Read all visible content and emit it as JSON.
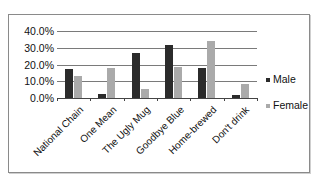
{
  "chart_data": {
    "type": "bar",
    "title": "",
    "xlabel": "",
    "ylabel": "",
    "ylim": [
      0,
      40
    ],
    "y_ticks": [
      "0.0%",
      "10.0%",
      "20.0%",
      "30.0%",
      "40.0%"
    ],
    "grid": true,
    "legend_position": "right",
    "categories": [
      "National Chain",
      "One Mean",
      "The Ugly Mug",
      "Goodbye Blue",
      "Home-brewed",
      "Don't drink"
    ],
    "series": [
      {
        "name": "Male",
        "color": "#2b2b2b",
        "values": [
          17.4,
          2.2,
          26.8,
          31.9,
          18.2,
          2.0
        ]
      },
      {
        "name": "Female",
        "color": "#aaaaaa",
        "values": [
          13.2,
          17.8,
          5.2,
          18.7,
          34.1,
          8.4
        ]
      }
    ]
  },
  "legend": {
    "male": "Male",
    "female": "Female"
  }
}
